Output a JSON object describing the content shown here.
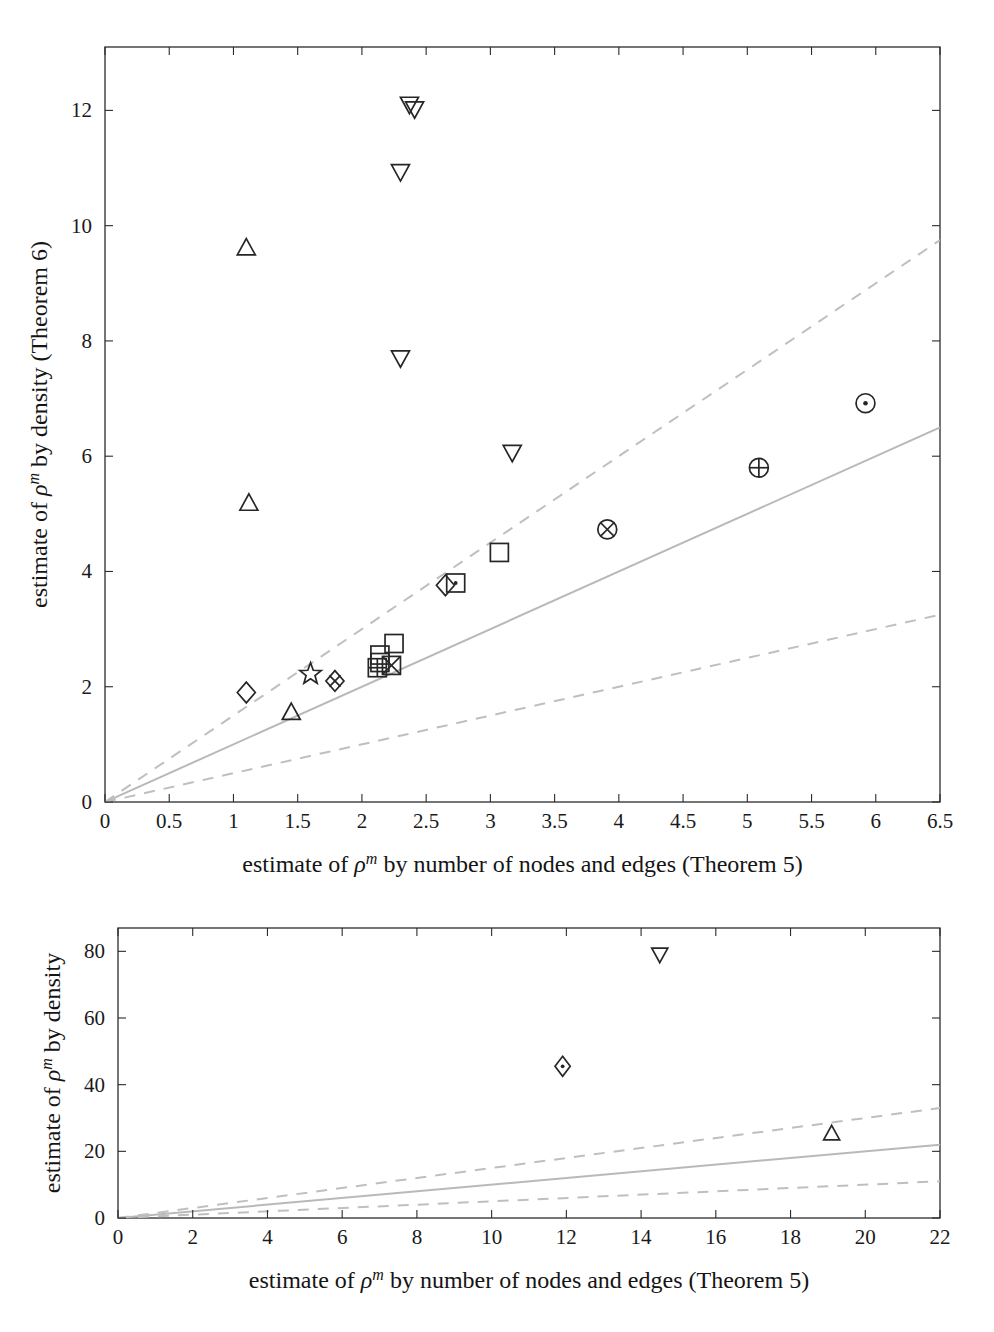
{
  "figure": {
    "background": "#ffffff",
    "ink_color": "#1a1a1a",
    "reference_line_color": "#bfbfbf",
    "marker_color": "#262626"
  },
  "chart_data": [
    {
      "id": "top-panel",
      "type": "scatter",
      "title": "",
      "xlabel": "estimate of ρᵐ by number of nodes and edges (Theorem 5)",
      "ylabel": "estimate of ρᵐ by density (Theorem 6)",
      "xlabel_parts": {
        "prefix": "estimate of ",
        "symbol": "ρ",
        "exponent": "m",
        "suffix": " by number of nodes and edges (Theorem 5)"
      },
      "ylabel_parts": {
        "prefix": "estimate of ",
        "symbol": "ρ",
        "exponent": "m",
        "suffix": " by density (Theorem 6)"
      },
      "xlim": [
        0,
        6.5
      ],
      "ylim": [
        0,
        13.1
      ],
      "xticks": [
        0,
        0.5,
        1,
        1.5,
        2,
        2.5,
        3,
        3.5,
        4,
        4.5,
        5,
        5.5,
        6,
        6.5
      ],
      "xticklabels": [
        "0",
        "0.5",
        "1",
        "1.5",
        "2",
        "2.5",
        "3",
        "3.5",
        "4",
        "4.5",
        "5",
        "5.5",
        "6",
        "6.5"
      ],
      "yticks": [
        0,
        2,
        4,
        6,
        8,
        10,
        12
      ],
      "yticklabels": [
        "0",
        "2",
        "4",
        "6",
        "8",
        "10",
        "12"
      ],
      "grid": false,
      "legend": "none",
      "reference_lines": [
        {
          "name": "identity",
          "style": "solid",
          "slope": 1.0,
          "intercept": 0
        },
        {
          "name": "upper-bound",
          "style": "dashed",
          "slope": 1.5,
          "intercept": 0
        },
        {
          "name": "lower-bound",
          "style": "dashed",
          "slope": 0.5,
          "intercept": 0
        }
      ],
      "points": [
        {
          "x": 2.37,
          "y": 12.1,
          "marker": "triangle-down"
        },
        {
          "x": 2.41,
          "y": 12.02,
          "marker": "triangle-down"
        },
        {
          "x": 2.3,
          "y": 10.93,
          "marker": "triangle-down"
        },
        {
          "x": 1.1,
          "y": 9.62,
          "marker": "triangle-up"
        },
        {
          "x": 2.3,
          "y": 7.7,
          "marker": "triangle-down"
        },
        {
          "x": 5.92,
          "y": 6.92,
          "marker": "circle-dot"
        },
        {
          "x": 3.17,
          "y": 6.06,
          "marker": "triangle-down"
        },
        {
          "x": 5.09,
          "y": 5.8,
          "marker": "circle-plus"
        },
        {
          "x": 1.12,
          "y": 5.19,
          "marker": "triangle-up"
        },
        {
          "x": 3.91,
          "y": 4.73,
          "marker": "circle-times"
        },
        {
          "x": 3.07,
          "y": 4.33,
          "marker": "square"
        },
        {
          "x": 2.73,
          "y": 3.8,
          "marker": "square-dot"
        },
        {
          "x": 2.65,
          "y": 3.76,
          "marker": "diamond"
        },
        {
          "x": 2.25,
          "y": 2.75,
          "marker": "square"
        },
        {
          "x": 2.14,
          "y": 2.55,
          "marker": "square"
        },
        {
          "x": 2.14,
          "y": 2.42,
          "marker": "square"
        },
        {
          "x": 2.23,
          "y": 2.37,
          "marker": "square-times"
        },
        {
          "x": 2.12,
          "y": 2.33,
          "marker": "square-plus"
        },
        {
          "x": 1.6,
          "y": 2.22,
          "marker": "star"
        },
        {
          "x": 1.79,
          "y": 2.1,
          "marker": "diamond-plus"
        },
        {
          "x": 1.1,
          "y": 1.9,
          "marker": "diamond"
        },
        {
          "x": 1.45,
          "y": 1.56,
          "marker": "triangle-up"
        }
      ]
    },
    {
      "id": "bottom-panel",
      "type": "scatter",
      "title": "",
      "xlabel": "estimate of ρᵐ by number of nodes and edges (Theorem 5)",
      "ylabel": "estimate of ρᵐ by density",
      "xlabel_parts": {
        "prefix": "estimate of ",
        "symbol": "ρ",
        "exponent": "m",
        "suffix": " by number of nodes and edges (Theorem 5)"
      },
      "ylabel_parts": {
        "prefix": "estimate of ",
        "symbol": "ρ",
        "exponent": "m",
        "suffix": " by density"
      },
      "xlim": [
        0,
        22
      ],
      "ylim": [
        0,
        87
      ],
      "xticks": [
        0,
        2,
        4,
        6,
        8,
        10,
        12,
        14,
        16,
        18,
        20,
        22
      ],
      "xticklabels": [
        "0",
        "2",
        "4",
        "6",
        "8",
        "10",
        "12",
        "14",
        "16",
        "18",
        "20",
        "22"
      ],
      "yticks": [
        0,
        20,
        40,
        60,
        80
      ],
      "yticklabels": [
        "0",
        "20",
        "40",
        "60",
        "80"
      ],
      "grid": false,
      "legend": "none",
      "reference_lines": [
        {
          "name": "identity",
          "style": "solid",
          "slope": 1.0,
          "intercept": 0
        },
        {
          "name": "upper-bound",
          "style": "dashed",
          "slope": 1.5,
          "intercept": 0
        },
        {
          "name": "lower-bound",
          "style": "dashed",
          "slope": 0.5,
          "intercept": 0
        }
      ],
      "points": [
        {
          "x": 14.5,
          "y": 79.0,
          "marker": "triangle-down"
        },
        {
          "x": 11.9,
          "y": 45.5,
          "marker": "diamond-dot"
        },
        {
          "x": 19.1,
          "y": 25.4,
          "marker": "triangle-up"
        }
      ]
    }
  ]
}
